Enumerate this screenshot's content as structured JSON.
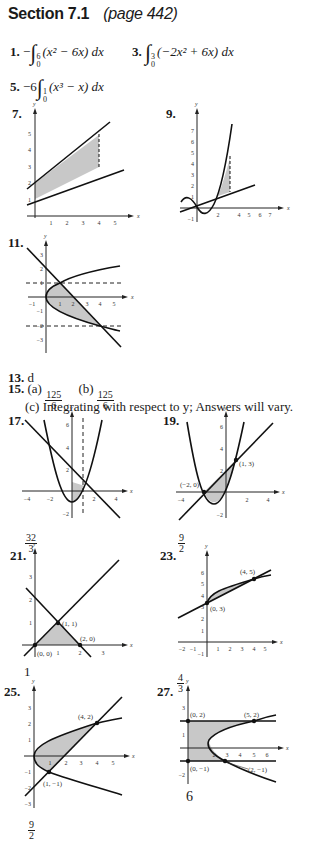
{
  "header": {
    "section": "Section 7.1",
    "page": "(page 442)"
  },
  "answers": {
    "a1": {
      "number": "1.",
      "prefix": "−",
      "lower": "0",
      "upper": "6",
      "integrand": "(x² − 6x) dx"
    },
    "a3": {
      "number": "3.",
      "prefix": "",
      "lower": "0",
      "upper": "3",
      "integrand": "(−2x² + 6x) dx"
    },
    "a5": {
      "number": "5.",
      "prefix": "−6",
      "lower": "0",
      "upper": "1",
      "integrand": "(x³ − x) dx"
    },
    "a7": {
      "number": "7."
    },
    "a9": {
      "number": "9."
    },
    "a11": {
      "number": "11."
    },
    "a13": {
      "number": "13.",
      "text": "d"
    },
    "a15": {
      "number": "15.",
      "a_label": "(a)",
      "a_num": "125",
      "a_den": "6",
      "b_label": "(b)",
      "b_num": "125",
      "b_den": "6",
      "c_text": "(c) Integrating with respect to y; Answers will vary."
    },
    "a17": {
      "number": "17.",
      "result_num": "32",
      "result_den": "3"
    },
    "a19": {
      "number": "19.",
      "result_num": "9",
      "result_den": "2"
    },
    "a21": {
      "number": "21.",
      "result": "1"
    },
    "a23": {
      "number": "23.",
      "result_num": "4",
      "result_den": "3"
    },
    "a25": {
      "number": "25.",
      "result_num": "9",
      "result_den": "2"
    },
    "a27": {
      "number": "27.",
      "result": "6"
    }
  },
  "graphs": {
    "g7": {
      "axis_x": "x",
      "axis_y": "y",
      "x_ticks": [
        "1",
        "2",
        "3",
        "4",
        "5"
      ],
      "y_ticks": [
        "1",
        "2",
        "3",
        "4",
        "5"
      ]
    },
    "g9": {
      "axis_x": "x",
      "axis_y": "y",
      "x_ticks": [
        "2",
        "4",
        "5",
        "6",
        "7"
      ],
      "y_ticks": [
        "−1",
        "1",
        "2",
        "3",
        "4",
        "5",
        "6",
        "7"
      ]
    },
    "g11": {
      "axis_x": "x",
      "axis_y": "y",
      "x_ticks": [
        "−1",
        "1",
        "2",
        "3",
        "4",
        "5"
      ],
      "y_ticks": [
        "3",
        "2",
        "1",
        "−1",
        "−2",
        "−3"
      ]
    },
    "g17": {
      "axis_x": "x",
      "axis_y": "y",
      "x_ticks": [
        "−4",
        "−2",
        "2",
        "4"
      ],
      "y_ticks": [
        "6",
        "4",
        "2",
        "−2"
      ]
    },
    "g19": {
      "axis_x": "x",
      "axis_y": "y",
      "x_ticks": [
        "−4",
        "2",
        "4"
      ],
      "y_ticks": [
        "6",
        "4",
        "2",
        "−2"
      ],
      "points": [
        "(−2, 0)",
        "(1, 3)"
      ]
    },
    "g21": {
      "axis_x": "x",
      "axis_y": "y",
      "x_ticks": [
        "1",
        "2",
        "3"
      ],
      "y_ticks": [
        "1",
        "2",
        "3"
      ],
      "points": [
        "(0, 0)",
        "(1, 1)",
        "(2, 0)"
      ]
    },
    "g23": {
      "axis_x": "x",
      "axis_y": "y",
      "x_ticks": [
        "−2",
        "−1",
        "1",
        "2",
        "3",
        "4",
        "5"
      ],
      "y_ticks": [
        "−1",
        "1",
        "2",
        "3",
        "4",
        "5",
        "6"
      ],
      "points": [
        "(0, 3)",
        "(4, 5)"
      ]
    },
    "g25": {
      "axis_x": "x",
      "axis_y": "y",
      "x_ticks": [
        "1",
        "2",
        "3",
        "4",
        "5"
      ],
      "y_ticks": [
        "3",
        "2",
        "1",
        "−1",
        "−2",
        "−3"
      ],
      "points": [
        "(4, 2)",
        "(1, −1)"
      ]
    },
    "g27": {
      "axis_x": "x",
      "axis_y": "y",
      "x_ticks": [
        "2",
        "3",
        "4",
        "5",
        "6"
      ],
      "y_ticks": [
        "3",
        "1",
        "−2"
      ],
      "points": [
        "(0, 2)",
        "(5, 2)",
        "(0, −1)",
        "(2, −1)"
      ]
    }
  }
}
